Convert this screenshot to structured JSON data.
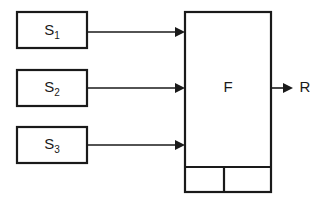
{
  "diagram": {
    "type": "block-diagram",
    "background_color": "#ffffff",
    "stroke_color": "#1a1a1a",
    "sources": [
      {
        "id": "s1",
        "base": "S",
        "subscript": "1",
        "full_label": "S1"
      },
      {
        "id": "s2",
        "base": "S",
        "subscript": "2",
        "full_label": "S2"
      },
      {
        "id": "s3",
        "base": "S",
        "subscript": "3",
        "full_label": "S3"
      }
    ],
    "processor": {
      "id": "f",
      "label": "F",
      "subcells": [
        {
          "id": "f-cell-left",
          "label": ""
        },
        {
          "id": "f-cell-right",
          "label": ""
        }
      ]
    },
    "output": {
      "id": "r",
      "label": "R"
    },
    "connections": [
      {
        "from": "s1",
        "to": "f",
        "arrow": true
      },
      {
        "from": "s2",
        "to": "f",
        "arrow": true
      },
      {
        "from": "s3",
        "to": "f",
        "arrow": true
      },
      {
        "from": "f",
        "to": "r",
        "arrow": true
      }
    ]
  }
}
